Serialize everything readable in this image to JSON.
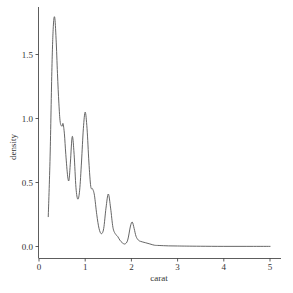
{
  "chart_data": {
    "type": "line",
    "title": "",
    "xlabel": "carat",
    "ylabel": "density",
    "xlim": [
      0,
      5
    ],
    "ylim": [
      0,
      1.8
    ],
    "grid": false,
    "legend": null,
    "x_ticks": [
      0,
      1,
      2,
      3,
      4,
      5
    ],
    "x_tick_labels": [
      "0",
      "1",
      "2",
      "3",
      "4",
      "5"
    ],
    "y_ticks": [
      0.0,
      0.5,
      1.0,
      1.5
    ],
    "y_tick_labels": [
      "0.0",
      "0.5",
      "1.0",
      "1.5"
    ],
    "series": [
      {
        "name": "density",
        "color": "#555555",
        "x": [
          0.2,
          0.24,
          0.28,
          0.31,
          0.34,
          0.37,
          0.4,
          0.43,
          0.46,
          0.5,
          0.52,
          0.55,
          0.58,
          0.62,
          0.65,
          0.68,
          0.72,
          0.76,
          0.8,
          0.84,
          0.88,
          0.92,
          0.96,
          1.0,
          1.04,
          1.08,
          1.12,
          1.16,
          1.2,
          1.25,
          1.3,
          1.35,
          1.4,
          1.45,
          1.5,
          1.55,
          1.6,
          1.65,
          1.7,
          1.75,
          1.8,
          1.86,
          1.92,
          1.98,
          2.02,
          2.06,
          2.1,
          2.15,
          2.2,
          2.3,
          2.4,
          2.5,
          2.6,
          2.8,
          3.0,
          3.2,
          3.5,
          4.0,
          4.5,
          5.01
        ],
        "y": [
          0.23,
          0.7,
          1.4,
          1.72,
          1.79,
          1.62,
          1.35,
          1.12,
          0.97,
          0.94,
          0.96,
          0.88,
          0.72,
          0.55,
          0.52,
          0.66,
          0.86,
          0.72,
          0.46,
          0.37,
          0.44,
          0.66,
          0.92,
          1.05,
          0.92,
          0.66,
          0.47,
          0.45,
          0.4,
          0.25,
          0.14,
          0.1,
          0.14,
          0.3,
          0.41,
          0.3,
          0.15,
          0.1,
          0.08,
          0.05,
          0.03,
          0.02,
          0.05,
          0.16,
          0.19,
          0.14,
          0.08,
          0.05,
          0.04,
          0.03,
          0.02,
          0.01,
          0.008,
          0.005,
          0.004,
          0.003,
          0.002,
          0.001,
          0.001,
          0.001
        ]
      }
    ]
  }
}
